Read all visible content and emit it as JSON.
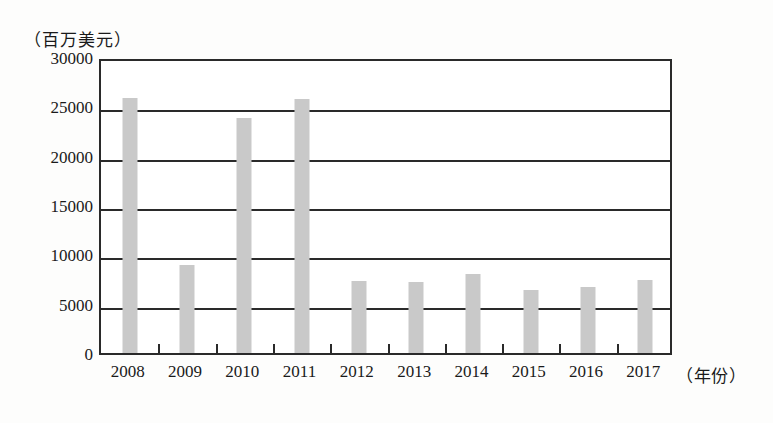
{
  "chart_data": {
    "type": "bar",
    "title": "",
    "subtitle": "",
    "unit_caption": "（百万美元）",
    "xlabel": "（年份）",
    "ylabel": "",
    "categories": [
      "2008",
      "2009",
      "2010",
      "2011",
      "2012",
      "2013",
      "2014",
      "2015",
      "2016",
      "2017"
    ],
    "values": [
      25800,
      8900,
      23800,
      25700,
      7300,
      7200,
      8000,
      6400,
      6700,
      7400
    ],
    "series": [
      {
        "name": "",
        "values": [
          25800,
          8900,
          23800,
          25700,
          7300,
          7200,
          8000,
          6400,
          6700,
          7400
        ]
      }
    ],
    "ylim": [
      0,
      30000
    ],
    "y_ticks": [
      0,
      5000,
      10000,
      15000,
      20000,
      25000,
      30000
    ],
    "y_tick_labels": [
      "0",
      "5000",
      "10000",
      "15000",
      "20000",
      "25000",
      "30000"
    ],
    "grid": true,
    "grid_axis": "y",
    "legend": false,
    "legend_position": "none",
    "bar_color": "#c9c9c9",
    "axis_color": "#2a2a2a"
  },
  "axes": {
    "y_labels": [
      "30000",
      "25000",
      "20000",
      "15000",
      "10000",
      "5000",
      "0"
    ],
    "x_labels": [
      "2008",
      "2009",
      "2010",
      "2011",
      "2012",
      "2013",
      "2014",
      "2015",
      "2016",
      "2017"
    ],
    "y_unit": "（百万美元）",
    "x_caption": "（年份）"
  }
}
